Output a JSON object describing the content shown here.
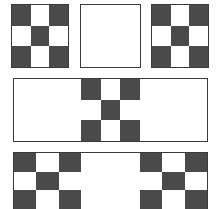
{
  "figure": {
    "background_color": "#ffffff",
    "dark_color": "#4a4a4a",
    "light_color": "#ffffff",
    "border_color": "#3a3a3a",
    "canvas": {
      "width": 217,
      "height": 209
    },
    "checker_pattern": {
      "rows": 3,
      "cols": 3,
      "cells": [
        "dark",
        "light",
        "dark",
        "light",
        "dark",
        "light",
        "dark",
        "light",
        "dark"
      ],
      "description": "3 by 3 checkerboard with dark corners and dark center"
    },
    "rows": [
      {
        "name": "top-row",
        "panels": [
          {
            "name": "top-left-checker",
            "type": "checker",
            "x": 11,
            "y": 4,
            "width": 58,
            "height": 64
          },
          {
            "name": "top-center-blank",
            "type": "blank",
            "x": 80,
            "y": 4,
            "width": 61,
            "height": 64
          },
          {
            "name": "top-right-checker",
            "type": "checker",
            "x": 151,
            "y": 4,
            "width": 58,
            "height": 64
          }
        ]
      },
      {
        "name": "middle-row",
        "strip": {
          "x": 13,
          "y": 78,
          "width": 195,
          "height": 64
        },
        "panels": [
          {
            "name": "middle-left-blank",
            "type": "blank",
            "width": 67,
            "height": 62
          },
          {
            "name": "middle-center-checker",
            "type": "checker",
            "width": 59,
            "height": 62
          },
          {
            "name": "middle-right-blank",
            "type": "blank",
            "width": 67,
            "height": 62
          }
        ]
      },
      {
        "name": "bottom-row",
        "strip": {
          "x": 13,
          "y": 152,
          "width": 195,
          "height": 57
        },
        "panels": [
          {
            "name": "bottom-left-checker",
            "type": "checker",
            "width": 67,
            "height": 56
          },
          {
            "name": "bottom-center-blank",
            "type": "blank",
            "width": 59,
            "height": 56
          },
          {
            "name": "bottom-right-checker",
            "type": "checker",
            "width": 67,
            "height": 56
          }
        ]
      }
    ]
  }
}
